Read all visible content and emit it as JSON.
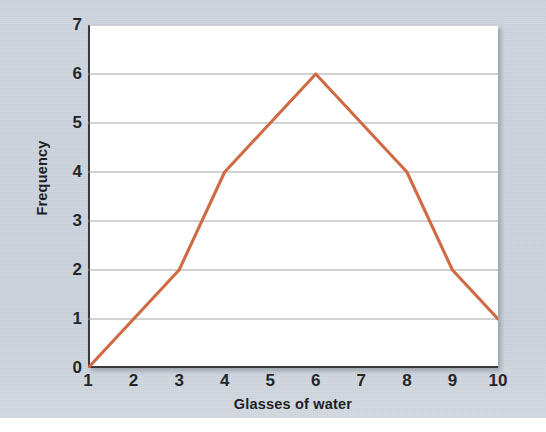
{
  "figure": {
    "background_color": "#ccd4dd",
    "plot_background_color": "#ffffff",
    "axis_color": "#3a3a3c",
    "gridline_color": "#9a9a9c",
    "line_color": "#d06a43",
    "label_color": "#25262a"
  },
  "chart_data": {
    "type": "line",
    "title": "",
    "subtitle": "",
    "xlabel": "Glasses of water",
    "ylabel": "Frequency",
    "x": [
      1,
      2,
      3,
      4,
      5,
      6,
      7,
      8,
      9,
      10
    ],
    "values": [
      0,
      1,
      2,
      4,
      5,
      6,
      5,
      4,
      2,
      1
    ],
    "series": [
      {
        "name": "Frequency",
        "color": "#d06a43",
        "values": [
          0,
          1,
          2,
          4,
          5,
          6,
          5,
          4,
          2,
          1
        ]
      }
    ],
    "xtick_labels": [
      "1",
      "2",
      "3",
      "4",
      "5",
      "6",
      "7",
      "8",
      "9",
      "10"
    ],
    "ytick_labels": [
      "0",
      "1",
      "2",
      "3",
      "4",
      "5",
      "6",
      "7"
    ],
    "xlim": [
      1,
      10
    ],
    "ylim": [
      0,
      7
    ],
    "grid": true,
    "grid_axis": "y",
    "legend": false,
    "legend_position": "none",
    "markers": false,
    "annotations": []
  }
}
